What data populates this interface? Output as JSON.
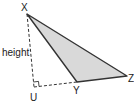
{
  "diagram": {
    "type": "geometry-triangle-height",
    "vertices": {
      "X": {
        "label": "X",
        "x": 27,
        "y": 14
      },
      "Y": {
        "label": "Y",
        "x": 77,
        "y": 82
      },
      "Z": {
        "label": "Z",
        "x": 127,
        "y": 76
      },
      "U": {
        "label": "U",
        "x": 34,
        "y": 87
      }
    },
    "height_label": "height",
    "fill_color": "#d9d9d9",
    "stroke_color": "#333333"
  }
}
